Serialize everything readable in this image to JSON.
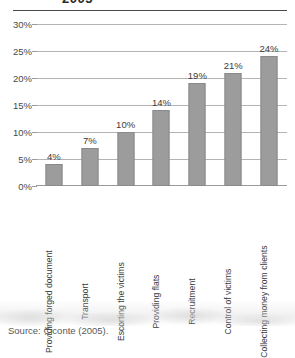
{
  "title": {
    "text": "2005",
    "note": "cut-off-at-top"
  },
  "source": {
    "label": "Source: Ciconte (2005)."
  },
  "colors": {
    "bar_fill": "#9c9c9c",
    "bar_border": "#8a8a8a",
    "gridline": "#b4b4b4",
    "top_rule": "#4a4a4a",
    "text": "#3b3b3b"
  },
  "chart_data": {
    "type": "bar",
    "title": "2005",
    "xlabel": "",
    "ylabel": "",
    "ylim": [
      0,
      30
    ],
    "yticks": [
      0,
      5,
      10,
      15,
      20,
      25,
      30
    ],
    "ytick_labels": [
      "0%",
      "5%",
      "10%",
      "15%",
      "20%",
      "25%",
      "30%"
    ],
    "grid": true,
    "legend": "none",
    "orientation": "vertical",
    "data_label_format": "{v}%",
    "categories": [
      "Providing forged document",
      "Transport",
      "Escorting the victims",
      "Providing flats",
      "Recruitment",
      "Control of victims",
      "Collecting money from clients"
    ],
    "values": [
      4,
      7,
      10,
      14,
      19,
      21,
      24
    ],
    "data_labels": [
      "4%",
      "7%",
      "10%",
      "14%",
      "19%",
      "21%",
      "24%"
    ]
  }
}
